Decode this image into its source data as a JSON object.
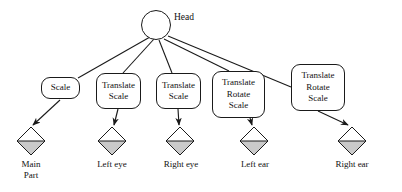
{
  "diagram": {
    "type": "tree",
    "title_text": "",
    "root": {
      "id": "head",
      "label": "Head",
      "shape": "circle"
    },
    "transform_nodes": [
      {
        "id": "node-scale-main",
        "shape": "rounded-rect",
        "lines": [
          "Scale"
        ]
      },
      {
        "id": "node-translate-scale-left-eye",
        "shape": "rounded-rect",
        "lines": [
          "Translate",
          "Scale"
        ]
      },
      {
        "id": "node-translate-scale-right-eye",
        "shape": "rounded-rect",
        "lines": [
          "Translate",
          "Scale"
        ]
      },
      {
        "id": "node-translate-rotate-scale-left-ear",
        "shape": "rounded-rect",
        "lines": [
          "Translate",
          "Rotate",
          "Scale"
        ]
      },
      {
        "id": "node-translate-rotate-scale-right-ear",
        "shape": "rounded-rect",
        "lines": [
          "Translate",
          "Rotate",
          "Scale"
        ]
      }
    ],
    "leaf_nodes": [
      {
        "id": "leaf-main-part",
        "shape": "half-shaded-diamond",
        "lines": [
          "Main",
          "Part"
        ]
      },
      {
        "id": "leaf-left-eye",
        "shape": "half-shaded-diamond",
        "lines": [
          "Left eye"
        ]
      },
      {
        "id": "leaf-right-eye",
        "shape": "half-shaded-diamond",
        "lines": [
          "Right eye"
        ]
      },
      {
        "id": "leaf-left-ear",
        "shape": "half-shaded-diamond",
        "lines": [
          "Left ear"
        ]
      },
      {
        "id": "leaf-right-ear",
        "shape": "half-shaded-diamond",
        "lines": [
          "Right ear"
        ]
      }
    ],
    "edges": [
      {
        "from": "head",
        "to": "node-scale-main",
        "style": "plain-line"
      },
      {
        "from": "head",
        "to": "node-translate-scale-left-eye",
        "style": "plain-line"
      },
      {
        "from": "head",
        "to": "node-translate-scale-right-eye",
        "style": "plain-line"
      },
      {
        "from": "head",
        "to": "node-translate-rotate-scale-left-ear",
        "style": "plain-line"
      },
      {
        "from": "head",
        "to": "node-translate-rotate-scale-right-ear",
        "style": "plain-line"
      },
      {
        "from": "node-scale-main",
        "to": "leaf-main-part",
        "style": "arrow"
      },
      {
        "from": "node-translate-scale-left-eye",
        "to": "leaf-left-eye",
        "style": "arrow"
      },
      {
        "from": "node-translate-scale-right-eye",
        "to": "leaf-right-eye",
        "style": "arrow"
      },
      {
        "from": "node-translate-rotate-scale-left-ear",
        "to": "leaf-left-ear",
        "style": "arrow"
      },
      {
        "from": "node-translate-rotate-scale-right-ear",
        "to": "leaf-right-ear",
        "style": "arrow"
      }
    ]
  },
  "colors": {
    "stroke": "#1a1a1a",
    "text": "#111111",
    "background": "#ffffff",
    "diamond_fill_top": "#ffffff",
    "diamond_fill_bottom": "#c9c9c9"
  }
}
